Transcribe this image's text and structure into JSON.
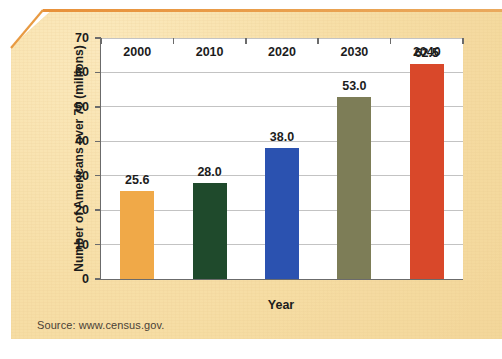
{
  "chart_data": {
    "type": "bar",
    "title": "",
    "xlabel": "Year",
    "ylabel": "Number of Americans over 70 (millions)",
    "categories": [
      "2000",
      "2010",
      "2020",
      "2030",
      "2040"
    ],
    "values": [
      25.6,
      28.0,
      38.0,
      53.0,
      62.5
    ],
    "value_labels": [
      "25.6",
      "28.0",
      "38.0",
      "53.0",
      "62.5"
    ],
    "bar_colors": [
      "#f0a948",
      "#1f4a2c",
      "#2b52b0",
      "#7d7d57",
      "#d9482a"
    ],
    "ylim": [
      0,
      70
    ],
    "yticks": [
      0,
      10,
      20,
      30,
      40,
      50,
      60,
      70
    ],
    "ytick_labels": [
      "0",
      "10",
      "20",
      "30",
      "40",
      "50",
      "60",
      "70"
    ],
    "grid": true,
    "grid_axis": "y",
    "legend": false,
    "legend_position": "none"
  },
  "figure": {
    "source_note": "Source: www.census.gov.",
    "panel_color": "#f7dfa8",
    "panel_top_rule_color": "#e8913a",
    "plot_background": "#ffffff",
    "gridline_color": "#c3c3c3",
    "axis_color": "#6b6b6b",
    "text_color": "#1c1c1c"
  }
}
